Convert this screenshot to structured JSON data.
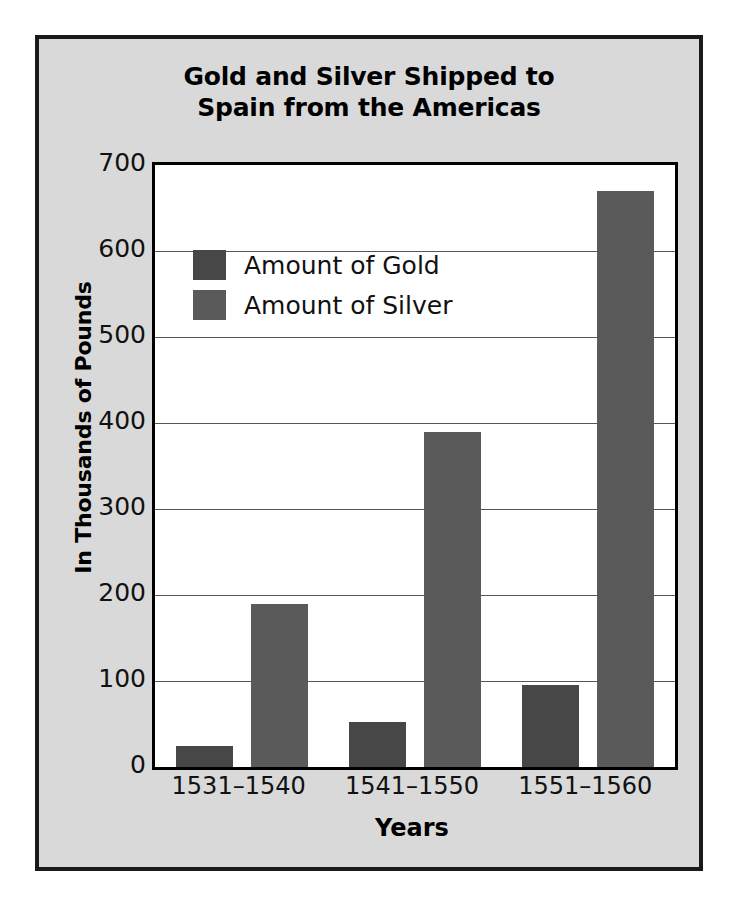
{
  "figure": {
    "background_color": "#d9d9d9",
    "border_color": "#1a1a1a",
    "plot_background": "#ffffff"
  },
  "title": "Gold and Silver Shipped to\nSpain from the Americas",
  "legend": {
    "position": "top-left-inside",
    "entries": [
      {
        "label": "Amount of Gold",
        "color": "#474747"
      },
      {
        "label": "Amount of Silver",
        "color": "#5a5a5a"
      }
    ]
  },
  "axes": {
    "y_title": "In Thousands of Pounds",
    "x_title": "Years",
    "y_ticks": [
      "0",
      "100",
      "200",
      "300",
      "400",
      "500",
      "600",
      "700"
    ],
    "x_ticks": [
      "1531–1540",
      "1541–1550",
      "1551–1560"
    ]
  },
  "chart_data": {
    "type": "bar",
    "title": "Gold and Silver Shipped to Spain from the Americas",
    "xlabel": "Years",
    "ylabel": "In Thousands of Pounds",
    "categories": [
      "1531–1540",
      "1541–1550",
      "1551–1560"
    ],
    "series": [
      {
        "name": "Amount of Gold",
        "color": "#474747",
        "values": [
          25,
          52,
          95
        ]
      },
      {
        "name": "Amount of Silver",
        "color": "#5a5a5a",
        "values": [
          190,
          390,
          670
        ]
      }
    ],
    "ylim": [
      0,
      700
    ],
    "ytick_step": 100,
    "grid": true,
    "grid_axis": "y",
    "legend_position": "upper left"
  }
}
